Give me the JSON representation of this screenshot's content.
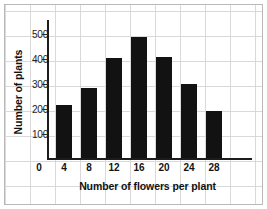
{
  "chart_data": {
    "type": "bar",
    "title": "",
    "xlabel": "Number of flowers per plant",
    "ylabel": "Number of plants",
    "categories": [
      "4",
      "8",
      "12",
      "16",
      "20",
      "24",
      "28"
    ],
    "values": [
      212,
      278,
      400,
      482,
      402,
      294,
      186
    ],
    "x_tick_labels": [
      "0",
      "4",
      "8",
      "12",
      "16",
      "20",
      "24",
      "28"
    ],
    "y_tick_labels": [
      "100",
      "200",
      "300",
      "400",
      "500"
    ],
    "y_ticks": [
      100,
      200,
      300,
      400,
      500
    ],
    "ylim": [
      0,
      560
    ],
    "xlim": [
      0,
      32
    ],
    "grid": true,
    "legend": "none",
    "bar_color": "#121212",
    "axis_color": "#1c1c1c",
    "grid_color": "#d9d9d9",
    "background": "#ffffff"
  }
}
